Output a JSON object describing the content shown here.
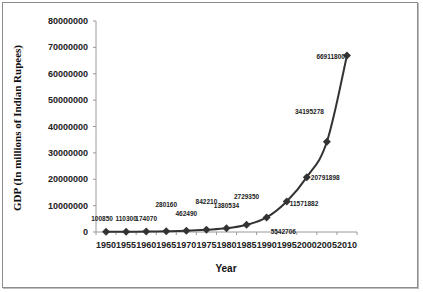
{
  "chart_data": {
    "type": "line",
    "title": "",
    "xlabel": "Year",
    "ylabel": "GDP (In millions of Indian Rupees)",
    "categories": [
      "1950",
      "1955",
      "1960",
      "1965",
      "1970",
      "1975",
      "1980",
      "1985",
      "1990",
      "1995",
      "2000",
      "2005",
      "2010"
    ],
    "series": [
      {
        "name": "GDP",
        "values": [
          100850,
          110300,
          174070,
          280160,
          462490,
          842210,
          1380534,
          2729350,
          5542706,
          11571882,
          20791898,
          34195278,
          66911800
        ]
      }
    ],
    "data_labels": [
      "100850",
      "110300",
      "174070",
      "280160",
      "462490",
      "842210",
      "1380534",
      "2729350",
      "5542706",
      "11571882",
      "20791898",
      "34195278",
      "66911800"
    ],
    "y_ticks": [
      "0",
      "10000000",
      "20000000",
      "30000000",
      "40000000",
      "50000000",
      "60000000",
      "70000000",
      "80000000"
    ],
    "ylim": [
      0,
      80000000
    ],
    "grid": false,
    "legend": "none",
    "marker": "diamond",
    "line_color": "#333333"
  }
}
